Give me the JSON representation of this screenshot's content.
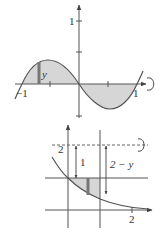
{
  "diagrams": [
    {
      "name": "sine-rotation",
      "description": "Region between sine-like curve and x-axis on [-1,1], rotated about x-axis",
      "labels": {
        "y_tick": "1",
        "x_neg": "−1",
        "x_pos": "1",
        "strip": "y"
      },
      "colors": {
        "fill": "#d3d3d3",
        "stroke": "#555555",
        "strip": "#777777"
      }
    },
    {
      "name": "curve-rotation-about-y2",
      "description": "Region between decreasing curve and line y=1, rotated about line y=2",
      "labels": {
        "y_tick": "2",
        "dist_one": "1",
        "dist_two_minus_y": "2 − y",
        "x_tick": "2"
      },
      "colors": {
        "fill": "#d3d3d3",
        "stroke": "#555555",
        "strip": "#777777",
        "dashed": "#666666"
      }
    }
  ]
}
